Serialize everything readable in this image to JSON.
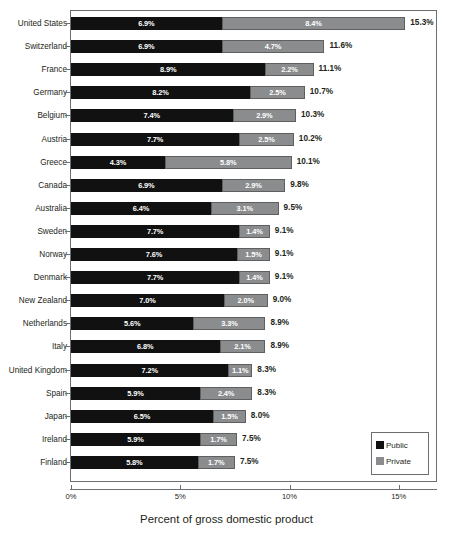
{
  "chart_data": {
    "type": "bar",
    "subtype": "stacked-horizontal",
    "title": "",
    "xlabel": "Percent of gross domestic product",
    "ylabel": "",
    "xlim": [
      0,
      16.8
    ],
    "xticks": [
      0,
      5,
      10,
      15
    ],
    "xtick_labels": [
      "0%",
      "5%",
      "10%",
      "15%"
    ],
    "grid": false,
    "legend_position": "bottom-right",
    "value_label_suffix": "%",
    "categories": [
      "United States",
      "Switzerland",
      "France",
      "Germany",
      "Belgium",
      "Austria",
      "Greece",
      "Canada",
      "Australia",
      "Sweden",
      "Norway",
      "Denmark",
      "New Zealand",
      "Netherlands",
      "Italy",
      "United Kingdom",
      "Spain",
      "Japan",
      "Ireland",
      "Finland"
    ],
    "series": [
      {
        "name": "Public",
        "color": "#111111",
        "values": [
          6.9,
          6.9,
          8.9,
          8.2,
          7.4,
          7.7,
          4.3,
          6.9,
          6.4,
          7.7,
          7.6,
          7.7,
          7.0,
          5.6,
          6.8,
          7.2,
          5.9,
          6.5,
          5.9,
          5.8
        ],
        "labels": [
          "6.9%",
          "6.9%",
          "8.9%",
          "8.2%",
          "7.4%",
          "7.7%",
          "4.3%",
          "6.9%",
          "6.4%",
          "7.7%",
          "7.6%",
          "7.7%",
          "7.0%",
          "5.6%",
          "6.8%",
          "7.2%",
          "5.9%",
          "6.5%",
          "5.9%",
          "5.8%"
        ]
      },
      {
        "name": "Private",
        "color": "#8a8c8e",
        "values": [
          8.4,
          4.7,
          2.2,
          2.5,
          2.9,
          2.5,
          5.8,
          2.9,
          3.1,
          1.4,
          1.5,
          1.4,
          2.0,
          3.3,
          2.1,
          1.1,
          2.4,
          1.5,
          1.7,
          1.7
        ],
        "labels": [
          "8.4%",
          "4.7%",
          "2.2%",
          "2.5%",
          "2.9%",
          "2.5%",
          "5.8%",
          "2.9%",
          "3.1%",
          "1.4%",
          "1.5%",
          "1.4%",
          "2.0%",
          "3.3%",
          "2.1%",
          "1.1%",
          "2.4%",
          "1.5%",
          "1.7%",
          "1.7%"
        ]
      }
    ],
    "totals": [
      15.3,
      11.6,
      11.1,
      10.7,
      10.3,
      10.2,
      10.1,
      9.8,
      9.5,
      9.1,
      9.1,
      9.1,
      9.0,
      8.9,
      8.9,
      8.3,
      8.3,
      8.0,
      7.5,
      7.5
    ],
    "total_labels": [
      "15.3%",
      "11.6%",
      "11.1%",
      "10.7%",
      "10.3%",
      "10.2%",
      "10.1%",
      "9.8%",
      "9.5%",
      "9.1%",
      "9.1%",
      "9.1%",
      "9.0%",
      "8.9%",
      "8.9%",
      "8.3%",
      "8.3%",
      "8.0%",
      "7.5%",
      "7.5%"
    ]
  },
  "legend": {
    "items": [
      {
        "label": "Public",
        "color": "#111111"
      },
      {
        "label": "Private",
        "color": "#8a8c8e"
      }
    ]
  },
  "axis": {
    "title": "Percent of gross domestic product",
    "ticks": [
      "0%",
      "5%",
      "10%",
      "15%"
    ]
  }
}
